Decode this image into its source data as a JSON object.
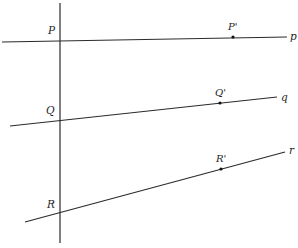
{
  "diagram": {
    "type": "geometry-figure",
    "colors": {
      "ink": "#2b2b2b",
      "background": "#ffffff"
    },
    "transversal": {
      "name": "transversal",
      "from": [
        60,
        3
      ],
      "to": [
        60,
        243
      ]
    },
    "lines": [
      {
        "id": "p",
        "label": "p",
        "from": [
          2,
          42
        ],
        "to": [
          287,
          37
        ],
        "label_pos": [
          290,
          40
        ],
        "intersection": {
          "label": "P",
          "pos": [
            60,
            41
          ],
          "label_pos": [
            48,
            34
          ]
        },
        "point": {
          "label": "P'",
          "pos": [
            233,
            37
          ],
          "label_pos": [
            228,
            30
          ]
        }
      },
      {
        "id": "q",
        "label": "q",
        "from": [
          10,
          126
        ],
        "to": [
          277,
          97
        ],
        "label_pos": [
          281,
          101
        ],
        "intersection": {
          "label": "Q",
          "pos": [
            60,
            120
          ],
          "label_pos": [
            46,
            114
          ]
        },
        "point": {
          "label": "Q'",
          "pos": [
            220,
            103
          ],
          "label_pos": [
            215,
            96
          ]
        }
      },
      {
        "id": "r",
        "label": "r",
        "from": [
          25,
          222
        ],
        "to": [
          285,
          152
        ],
        "label_pos": [
          289,
          154
        ],
        "intersection": {
          "label": "R",
          "pos": [
            60,
            213
          ],
          "label_pos": [
            47,
            208
          ]
        },
        "point": {
          "label": "R'",
          "pos": [
            221,
            169
          ],
          "label_pos": [
            216,
            162
          ]
        }
      }
    ]
  }
}
